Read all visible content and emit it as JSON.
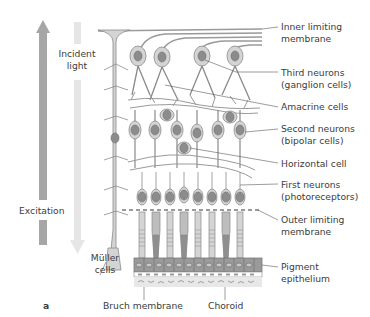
{
  "figure": {
    "panel_label": "a",
    "left_labels": {
      "incident_light": "Incident\nlight",
      "excitation": "Excitation",
      "muller_cells": "Müller\ncells"
    },
    "right_labels": [
      {
        "id": "inner-limiting-membrane",
        "text": "Inner limiting\nmembrane"
      },
      {
        "id": "third-neurons",
        "text": "Third neurons\n(ganglion cells)"
      },
      {
        "id": "amacrine-cells",
        "text": "Amacrine cells"
      },
      {
        "id": "second-neurons",
        "text": "Second neurons\n(bipolar cells)"
      },
      {
        "id": "horizontal-cell",
        "text": "Horizontal cell"
      },
      {
        "id": "first-neurons",
        "text": "First neurons\n(photoreceptors)"
      },
      {
        "id": "outer-limiting-membrane",
        "text": "Outer limiting\nmembrane"
      },
      {
        "id": "pigment-epithelium",
        "text": "Pigment\nepithelium"
      }
    ],
    "bottom_labels": {
      "bruch_membrane": "Bruch membrane",
      "choroid": "Choroid"
    },
    "colors": {
      "excitation_arrow": "#a6a6a6",
      "incident_light_arrow": "#e6e6e6",
      "cell_fill": "#d4d4d4",
      "cell_stroke": "#8a8a8a",
      "nucleus": "#8c8c8c",
      "leader_line": "#5a5a5a"
    }
  }
}
